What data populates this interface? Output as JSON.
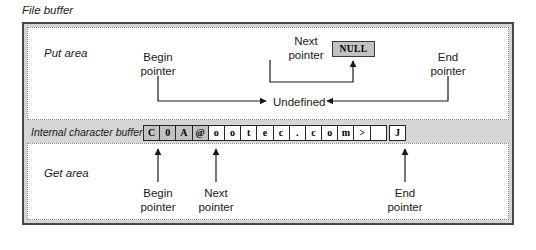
{
  "diagram": {
    "title": "File buffer",
    "areas": {
      "put_area_label": "Put area",
      "get_area_label": "Get area",
      "buffer_label": "Internal character buffer"
    },
    "null_chip": "NULL",
    "undefined_label": "Undefined",
    "put_pointers": {
      "begin": {
        "line1": "Begin",
        "line2": "pointer"
      },
      "next": {
        "line1": "Next",
        "line2": "pointer"
      },
      "end": {
        "line1": "End",
        "line2": "pointer"
      }
    },
    "get_pointers": {
      "begin": {
        "line1": "Begin",
        "line2": "pointer"
      },
      "next": {
        "line1": "Next",
        "line2": "pointer"
      },
      "end": {
        "line1": "End",
        "line2": "pointer"
      }
    },
    "buffer_cells": [
      {
        "char": "C",
        "shaded": true
      },
      {
        "char": "0",
        "shaded": true
      },
      {
        "char": "A",
        "shaded": true
      },
      {
        "char": "@",
        "shaded": true
      },
      {
        "char": "o",
        "shaded": false
      },
      {
        "char": "o",
        "shaded": false
      },
      {
        "char": "t",
        "shaded": false
      },
      {
        "char": "e",
        "shaded": false
      },
      {
        "char": "c",
        "shaded": false
      },
      {
        "char": ".",
        "shaded": false
      },
      {
        "char": "c",
        "shaded": false
      },
      {
        "char": "o",
        "shaded": false
      },
      {
        "char": "m",
        "shaded": false
      },
      {
        "char": ">",
        "shaded": false
      },
      {
        "char": "",
        "shaded": false
      },
      {
        "char": "J",
        "shaded": false
      }
    ],
    "colors": {
      "frame_border": "#4a4a4a",
      "frame_fill": "#d5d5d5",
      "area_fill": "#ffffff",
      "cell_shaded": "#c2c2c2",
      "ink": "#1a1a1a"
    }
  }
}
